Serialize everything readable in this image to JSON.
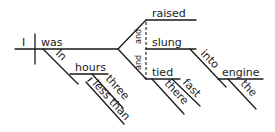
{
  "diagram": {
    "type": "sentence-diagram",
    "sentence_words": {
      "subject": "I",
      "verb": "was",
      "prep1": "In",
      "prep1_object": "hours",
      "adj_three": "three",
      "adv_less_than": "less than",
      "verb_raised": "raised",
      "verb_slung": "slung",
      "verb_tied": "tied",
      "conj1": "and",
      "conj2": "and",
      "prep2": "into",
      "prep2_object": "engine",
      "article_the": "the",
      "adv_there": "there",
      "adv_fast": "fast"
    },
    "colors": {
      "ink": "#1a1a1a",
      "background": "#ffffff"
    }
  }
}
